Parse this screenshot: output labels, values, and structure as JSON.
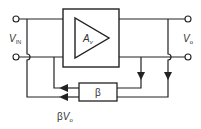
{
  "diagram": {
    "type": "feedback-amplifier-block-diagram",
    "amplifier": {
      "label": "A",
      "subscript": "v"
    },
    "feedback": {
      "label": "β"
    },
    "input": {
      "label": "V",
      "subscript": "IN"
    },
    "output": {
      "label": "V",
      "subscript": "o"
    },
    "feedback_signal": {
      "prefix": "β",
      "label": "V",
      "subscript": "o"
    }
  }
}
